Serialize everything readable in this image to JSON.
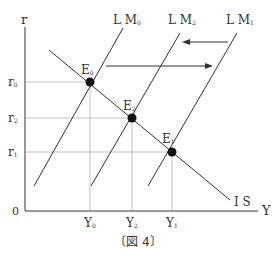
{
  "axes": {
    "y_label": "r",
    "x_label": "Y",
    "origin_label": "0"
  },
  "curves": {
    "lm0": "L M",
    "lm0_sub": "0",
    "lm2": "L M",
    "lm2_sub": "2",
    "lm1": "L M",
    "lm1_sub": "1",
    "is": "I S"
  },
  "points": {
    "e0": "E",
    "e0_sub": "0",
    "e2": "E",
    "e2_sub": "2",
    "e1": "E",
    "e1_sub": "1"
  },
  "y_ticks": {
    "r0": "r",
    "r0_sub": "0",
    "r2": "r",
    "r2_sub": "2",
    "r1": "r",
    "r1_sub": "1"
  },
  "x_ticks": {
    "y0": "Y",
    "y0_sub": "0",
    "y2": "Y",
    "y2_sub": "2",
    "y1": "Y",
    "y1_sub": "1"
  },
  "caption": "〔図 4〕"
}
